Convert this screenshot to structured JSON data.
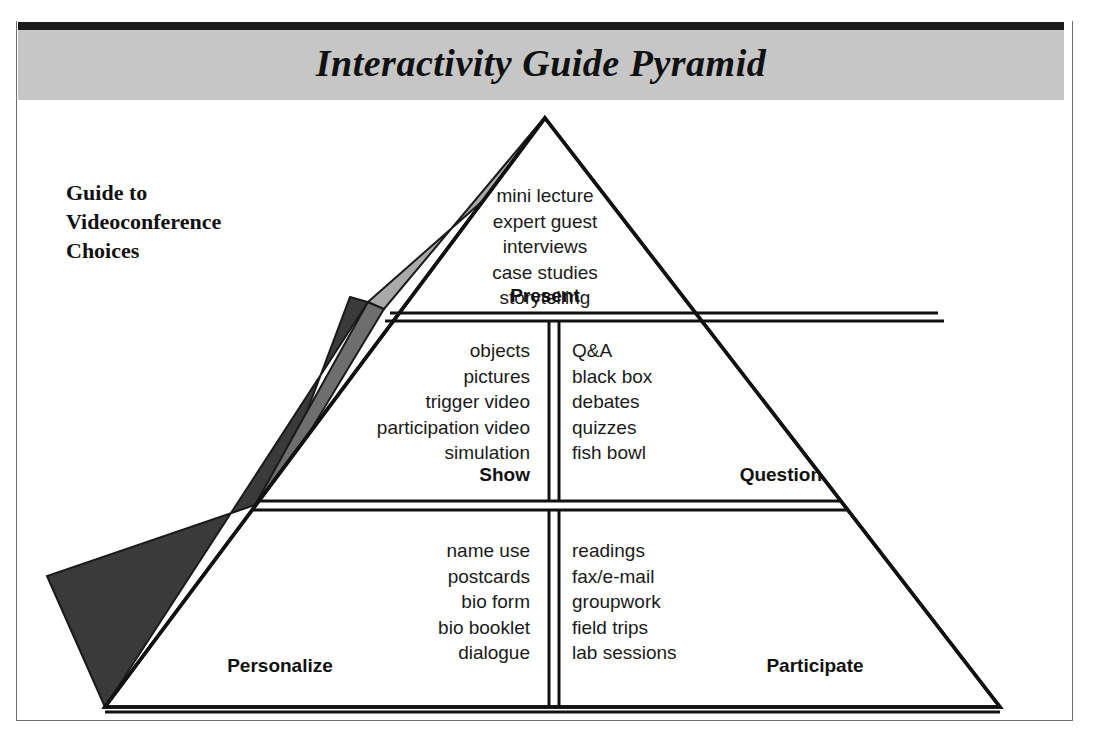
{
  "header": {
    "title": "Interactivity Guide Pyramid"
  },
  "caption": {
    "lines": [
      "Guide to",
      "Videoconference",
      "Choices"
    ]
  },
  "colors": {
    "header_band": "#c6c6c6",
    "header_rule": "#1c1c1c",
    "frame_border": "#6f6f6f",
    "wedge_top": "#a9a9a9",
    "wedge_middle": "#6e6e6e",
    "wedge_bottom": "#3a3a3a",
    "ink": "#111111",
    "paper": "#ffffff"
  },
  "pyramid": {
    "tiers": [
      {
        "id": "tier-1",
        "sections": [
          {
            "id": "present",
            "label": "Present",
            "align": "center",
            "items": [
              "mini lecture",
              "expert guest",
              "interviews",
              "case studies",
              "storytelling"
            ]
          }
        ]
      },
      {
        "id": "tier-2",
        "sections": [
          {
            "id": "show",
            "label": "Show",
            "align": "right",
            "items": [
              "objects",
              "pictures",
              "trigger video",
              "participation video",
              "simulation"
            ]
          },
          {
            "id": "question",
            "label": "Question",
            "align": "left",
            "items": [
              "Q&A",
              "black box",
              "debates",
              "quizzes",
              "fish bowl"
            ]
          }
        ]
      },
      {
        "id": "tier-3",
        "sections": [
          {
            "id": "personalize",
            "label": "Personalize",
            "align": "right",
            "items": [
              "name use",
              "postcards",
              "bio form",
              "bio booklet",
              "dialogue"
            ]
          },
          {
            "id": "participate",
            "label": "Participate",
            "align": "left",
            "items": [
              "readings",
              "fax/e-mail",
              "groupwork",
              "field trips",
              "lab sessions"
            ]
          }
        ]
      }
    ]
  }
}
